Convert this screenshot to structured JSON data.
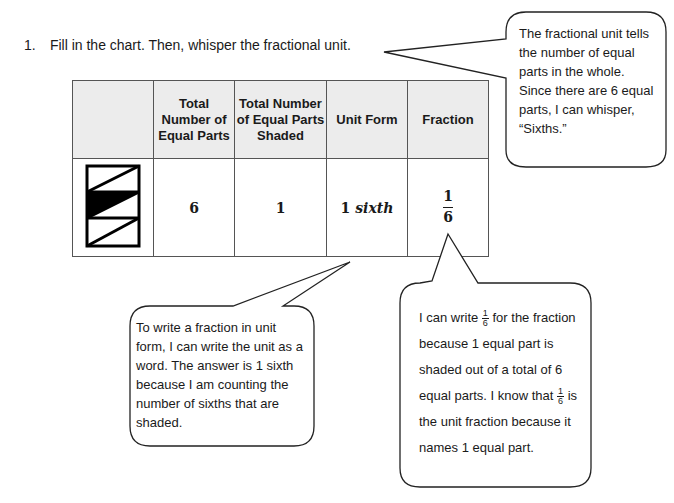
{
  "instruction": {
    "number": "1.",
    "text": "Fill in the chart.  Then, whisper the fractional unit."
  },
  "table": {
    "headers": [
      "",
      "Total Number of Equal Parts",
      "Total Number of Equal Parts Shaded",
      "Unit Form",
      "Fraction"
    ],
    "row": {
      "shape": "rectangle divided into 6 equal triangular parts, 1 shaded",
      "total_parts": "6",
      "parts_shaded": "1",
      "unit_form_number": "1",
      "unit_form_word": "sixth",
      "fraction_numerator": "1",
      "fraction_denominator": "6"
    }
  },
  "bubbles": {
    "top_right": "The fractional unit tells the number of equal parts in the whole.  Since there are 6 equal parts, I can whisper, “Sixths.”",
    "bottom_left": "To write a fraction in unit form, I can write the unit as a word.  The answer is 1 sixth because I am counting the number of sixths that are shaded.",
    "bottom_right": {
      "part1": "I can write",
      "part2": "for the fraction because 1 equal part is shaded out of a total of 6 equal parts.  I know that",
      "part3": "is the unit fraction because it names 1 equal part.",
      "frac_num": "1",
      "frac_den": "6"
    }
  }
}
